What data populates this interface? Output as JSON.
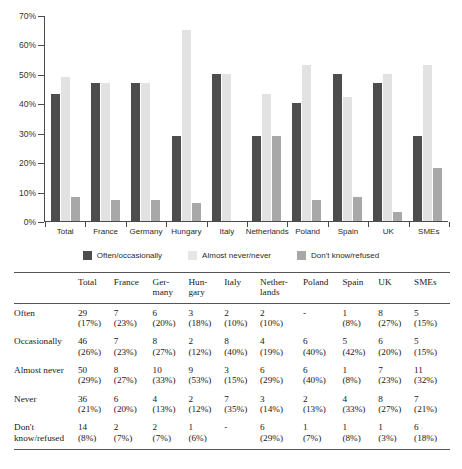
{
  "chart_data": {
    "type": "bar",
    "title": "",
    "xlabel": "",
    "ylabel": "",
    "ylim": [
      0,
      70
    ],
    "grid": false,
    "legend_position": "bottom",
    "ytick_labels": [
      "70%",
      "60%",
      "50%",
      "40%",
      "30%",
      "20%",
      "10%",
      "0%"
    ],
    "ytick_values": [
      70,
      60,
      50,
      40,
      30,
      20,
      10,
      0
    ],
    "categories": [
      "Total",
      "France",
      "Germany",
      "Hungary",
      "Italy",
      "Netherlands",
      "Poland",
      "Spain",
      "UK",
      "SMEs"
    ],
    "series": [
      {
        "name": "Often/occasionally",
        "color": "#4d4d4d",
        "values": [
          43,
          47,
          47,
          29,
          50,
          29,
          40,
          50,
          47,
          29
        ]
      },
      {
        "name": "Almost never/never",
        "color": "#e2e2e2",
        "values": [
          49,
          47,
          47,
          65,
          50,
          43,
          53,
          42,
          50,
          53
        ]
      },
      {
        "name": "Don't know/refused",
        "color": "#a8a8a8",
        "values": [
          8,
          7,
          7,
          6,
          null,
          29,
          7,
          8,
          3,
          18
        ]
      }
    ]
  },
  "legend": {
    "items": [
      {
        "label": "Often/occasionally",
        "swatch": "s0"
      },
      {
        "label": "Almost never/never",
        "swatch": "s1"
      },
      {
        "label": "Don't know/refused",
        "swatch": "s2"
      }
    ]
  },
  "table": {
    "row_header_label": "",
    "columns": [
      {
        "line1": "Total",
        "line2": ""
      },
      {
        "line1": "France",
        "line2": ""
      },
      {
        "line1": "Ger-",
        "line2": "many"
      },
      {
        "line1": "Hun-",
        "line2": "gary"
      },
      {
        "line1": "Italy",
        "line2": ""
      },
      {
        "line1": "Nether-",
        "line2": "lands"
      },
      {
        "line1": "Poland",
        "line2": ""
      },
      {
        "line1": "Spain",
        "line2": ""
      },
      {
        "line1": "UK",
        "line2": ""
      },
      {
        "line1": "SMEs",
        "line2": ""
      }
    ],
    "rows": [
      {
        "label_line1": "Often",
        "label_line2": "",
        "counts": [
          "29",
          "7",
          "6",
          "3",
          "2",
          "2",
          "-",
          "1",
          "8",
          "5"
        ],
        "percents": [
          "(17%)",
          "(23%)",
          "(20%)",
          "(18%)",
          "(10%)",
          "(10%)",
          "",
          "(8%)",
          "(27%)",
          "(15%)"
        ]
      },
      {
        "label_line1": "Occasionally",
        "label_line2": "",
        "counts": [
          "46",
          "7",
          "8",
          "2",
          "8",
          "4",
          "6",
          "5",
          "6",
          "5"
        ],
        "percents": [
          "(26%)",
          "(23%)",
          "(27%)",
          "(12%)",
          "(40%)",
          "(19%)",
          "(40%)",
          "(42%)",
          "(20%)",
          "(15%)"
        ]
      },
      {
        "label_line1": "Almost never",
        "label_line2": "",
        "counts": [
          "50",
          "8",
          "10",
          "9",
          "3",
          "6",
          "6",
          "1",
          "7",
          "11"
        ],
        "percents": [
          "(29%)",
          "(27%)",
          "(33%)",
          "(53%)",
          "(15%)",
          "(29%)",
          "(40%)",
          "(8%)",
          "(23%)",
          "(32%)"
        ]
      },
      {
        "label_line1": "Never",
        "label_line2": "",
        "counts": [
          "36",
          "6",
          "4",
          "2",
          "7",
          "3",
          "2",
          "4",
          "8",
          "7"
        ],
        "percents": [
          "(21%)",
          "(20%)",
          "(13%)",
          "(12%)",
          "(35%)",
          "(14%)",
          "(13%)",
          "(33%)",
          "(27%)",
          "(21%)"
        ]
      },
      {
        "label_line1": "Don't",
        "label_line2": "know/refused",
        "counts": [
          "14",
          "2",
          "2",
          "1",
          "-",
          "6",
          "1",
          "1",
          "1",
          "6"
        ],
        "percents": [
          "(8%)",
          "(7%)",
          "(7%)",
          "(6%)",
          "",
          "(29%)",
          "(7%)",
          "(8%)",
          "(3%)",
          "(18%)"
        ]
      }
    ]
  }
}
